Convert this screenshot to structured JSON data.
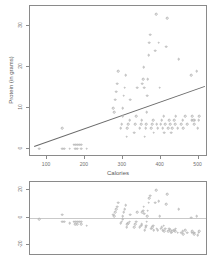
{
  "chart_data": [
    {
      "id": "scatter-protein-vs-calories",
      "type": "scatter",
      "title": "",
      "xlabel": "Calories",
      "ylabel": "Protein (in grams)",
      "xlim": [
        55,
        525
      ],
      "ylim": [
        -2,
        35
      ],
      "xticks": [
        100,
        200,
        300,
        400,
        500
      ],
      "yticks": [
        0,
        10,
        20,
        30
      ],
      "grid": false,
      "legend": "none",
      "point_color": "#b6b6b6",
      "line_color": "#6a6a6a",
      "regression_line": {
        "x0": 65,
        "y0": 0.8,
        "x1": 515,
        "y1": 15.5,
        "slope": 0.0327,
        "intercept": -1.32
      },
      "points": [
        [
          80,
          0
        ],
        [
          140,
          0
        ],
        [
          145,
          0
        ],
        [
          160,
          0
        ],
        [
          175,
          0
        ],
        [
          180,
          0
        ],
        [
          190,
          0
        ],
        [
          205,
          0
        ],
        [
          170,
          1
        ],
        [
          175,
          1
        ],
        [
          180,
          1
        ],
        [
          185,
          1
        ],
        [
          190,
          1
        ],
        [
          140,
          5
        ],
        [
          275,
          10
        ],
        [
          278,
          9
        ],
        [
          280,
          12
        ],
        [
          282,
          14
        ],
        [
          285,
          16
        ],
        [
          288,
          19
        ],
        [
          295,
          5
        ],
        [
          297,
          6
        ],
        [
          300,
          8
        ],
        [
          300,
          10
        ],
        [
          302,
          13
        ],
        [
          305,
          15
        ],
        [
          308,
          18
        ],
        [
          310,
          3
        ],
        [
          312,
          5
        ],
        [
          315,
          6
        ],
        [
          318,
          7
        ],
        [
          320,
          12
        ],
        [
          330,
          4
        ],
        [
          333,
          6
        ],
        [
          336,
          8
        ],
        [
          338,
          15
        ],
        [
          345,
          5
        ],
        [
          348,
          6
        ],
        [
          350,
          7
        ],
        [
          352,
          16
        ],
        [
          354,
          17
        ],
        [
          355,
          20
        ],
        [
          356,
          15
        ],
        [
          358,
          3
        ],
        [
          360,
          5
        ],
        [
          362,
          6
        ],
        [
          363,
          9
        ],
        [
          365,
          13
        ],
        [
          366,
          17
        ],
        [
          368,
          23
        ],
        [
          370,
          26
        ],
        [
          372,
          28
        ],
        [
          375,
          5
        ],
        [
          378,
          6
        ],
        [
          380,
          7
        ],
        [
          382,
          4
        ],
        [
          385,
          24
        ],
        [
          388,
          33
        ],
        [
          390,
          6
        ],
        [
          392,
          5
        ],
        [
          395,
          26
        ],
        [
          398,
          15
        ],
        [
          400,
          6
        ],
        [
          403,
          7
        ],
        [
          405,
          5
        ],
        [
          408,
          8
        ],
        [
          410,
          4
        ],
        [
          412,
          6
        ],
        [
          415,
          25
        ],
        [
          418,
          32
        ],
        [
          420,
          5
        ],
        [
          422,
          7
        ],
        [
          425,
          6
        ],
        [
          428,
          4
        ],
        [
          430,
          5
        ],
        [
          435,
          7
        ],
        [
          438,
          6
        ],
        [
          440,
          8
        ],
        [
          445,
          5
        ],
        [
          448,
          22
        ],
        [
          455,
          6
        ],
        [
          458,
          7
        ],
        [
          460,
          5
        ],
        [
          465,
          8
        ],
        [
          470,
          6
        ],
        [
          480,
          18
        ],
        [
          482,
          7
        ],
        [
          484,
          8
        ],
        [
          486,
          7
        ],
        [
          488,
          6
        ],
        [
          490,
          7
        ],
        [
          495,
          19
        ],
        [
          498,
          5
        ],
        [
          500,
          7
        ],
        [
          502,
          8
        ]
      ]
    },
    {
      "id": "residuals-vs-calories",
      "type": "scatter",
      "title": "",
      "xlabel": "",
      "ylabel": "",
      "xlim": [
        55,
        525
      ],
      "ylim": [
        -28,
        26
      ],
      "xticks": [],
      "yticks": [
        -20,
        0,
        20
      ],
      "grid": false,
      "legend": "none",
      "point_color": "#b6b6b6",
      "zero_line_color": "#c9c9c9",
      "points": [
        [
          80,
          -1
        ],
        [
          140,
          -3
        ],
        [
          145,
          -3
        ],
        [
          160,
          -4
        ],
        [
          175,
          -5
        ],
        [
          180,
          -5
        ],
        [
          190,
          -5
        ],
        [
          205,
          -6
        ],
        [
          170,
          -3
        ],
        [
          175,
          -3
        ],
        [
          180,
          -3
        ],
        [
          185,
          -3
        ],
        [
          190,
          -3
        ],
        [
          140,
          2
        ],
        [
          275,
          2
        ],
        [
          278,
          1
        ],
        [
          280,
          4
        ],
        [
          282,
          6
        ],
        [
          285,
          8
        ],
        [
          288,
          11
        ],
        [
          295,
          -4
        ],
        [
          297,
          -3
        ],
        [
          300,
          -1
        ],
        [
          300,
          1
        ],
        [
          302,
          4
        ],
        [
          305,
          6
        ],
        [
          308,
          9
        ],
        [
          310,
          -7
        ],
        [
          312,
          -5
        ],
        [
          315,
          -4
        ],
        [
          318,
          -3
        ],
        [
          320,
          2
        ],
        [
          330,
          -7
        ],
        [
          333,
          -5
        ],
        [
          336,
          -3
        ],
        [
          338,
          4
        ],
        [
          345,
          -7
        ],
        [
          348,
          -6
        ],
        [
          350,
          -5
        ],
        [
          352,
          4
        ],
        [
          354,
          5
        ],
        [
          355,
          8
        ],
        [
          356,
          3
        ],
        [
          358,
          -9
        ],
        [
          360,
          -7
        ],
        [
          362,
          -6
        ],
        [
          363,
          -3
        ],
        [
          365,
          1
        ],
        [
          366,
          5
        ],
        [
          368,
          11
        ],
        [
          370,
          14
        ],
        [
          372,
          16
        ],
        [
          375,
          -8
        ],
        [
          378,
          -7
        ],
        [
          380,
          -6
        ],
        [
          382,
          -9
        ],
        [
          385,
          11
        ],
        [
          388,
          20
        ],
        [
          390,
          -8
        ],
        [
          392,
          -9
        ],
        [
          395,
          12
        ],
        [
          398,
          1
        ],
        [
          400,
          -8
        ],
        [
          403,
          -7
        ],
        [
          405,
          -9
        ],
        [
          408,
          -6
        ],
        [
          410,
          -10
        ],
        [
          412,
          -8
        ],
        [
          415,
          10
        ],
        [
          418,
          17
        ],
        [
          420,
          -10
        ],
        [
          422,
          -8
        ],
        [
          425,
          -9
        ],
        [
          428,
          -11
        ],
        [
          430,
          -10
        ],
        [
          435,
          -9
        ],
        [
          438,
          -10
        ],
        [
          440,
          -8
        ],
        [
          445,
          -11
        ],
        [
          448,
          6
        ],
        [
          455,
          -11
        ],
        [
          458,
          -10
        ],
        [
          460,
          -12
        ],
        [
          465,
          -9
        ],
        [
          470,
          -11
        ],
        [
          480,
          0
        ],
        [
          482,
          -11
        ],
        [
          484,
          -10
        ],
        [
          486,
          -11
        ],
        [
          488,
          -12
        ],
        [
          490,
          -11
        ],
        [
          495,
          1
        ],
        [
          498,
          -13
        ],
        [
          500,
          -11
        ],
        [
          502,
          -10
        ]
      ]
    }
  ]
}
